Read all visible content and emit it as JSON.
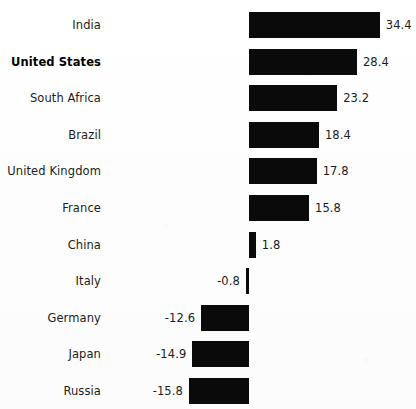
{
  "chart_data": {
    "type": "bar",
    "orientation": "horizontal",
    "title": "",
    "subtitle": "",
    "xlabel": "",
    "ylabel": "",
    "grid": false,
    "legend": null,
    "axis": {
      "zero_baseline": 0,
      "xlim": [
        -15.8,
        34.4
      ],
      "tick_labels": [],
      "show_axis_line": false
    },
    "categories": [
      "India",
      "United States",
      "South Africa",
      "Brazil",
      "United Kingdom",
      "France",
      "China",
      "Italy",
      "Germany",
      "Japan",
      "Russia"
    ],
    "values": [
      34.4,
      28.4,
      23.2,
      18.4,
      17.8,
      15.8,
      1.8,
      -0.8,
      -12.6,
      -14.9,
      -15.8
    ],
    "value_labels": [
      "34.4",
      "28.4",
      "23.2",
      "18.4",
      "17.8",
      "15.8",
      "1.8",
      "-0.8",
      "-12.6",
      "-14.9",
      "-15.8"
    ],
    "highlighted_category": "United States",
    "bar_color": "#0a0a0a",
    "background_color": "#fefefe",
    "text_color": "#1c1c1c"
  }
}
